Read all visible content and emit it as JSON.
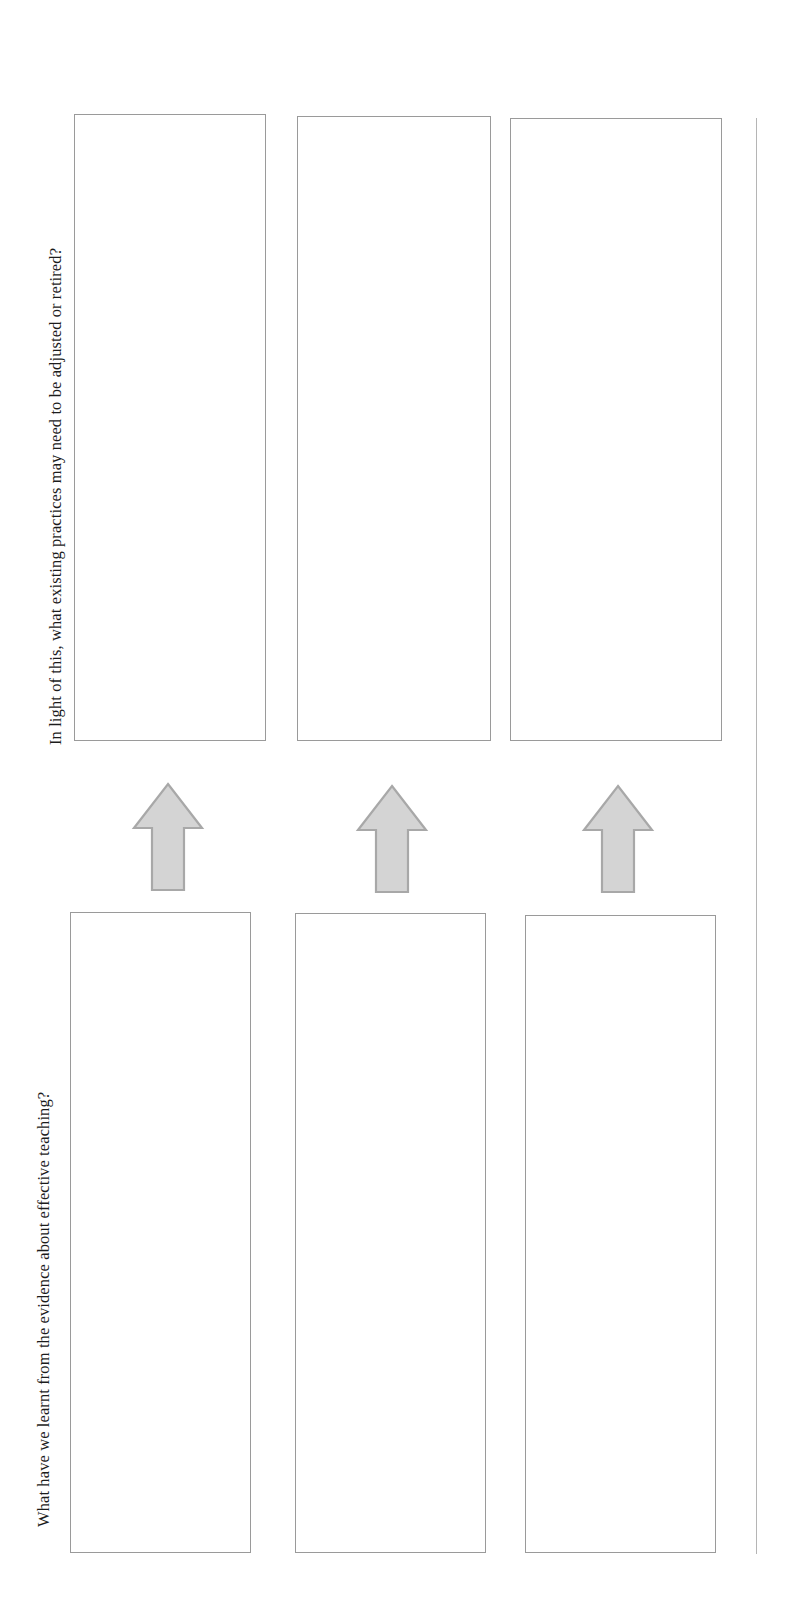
{
  "document": {
    "type": "worksheet-template",
    "orientation": "landscape-rotated",
    "background_color": "#ffffff",
    "box_border_color": "#9a9a9a",
    "arrow_fill_color": "#d4d4d4",
    "arrow_stroke_color": "#a8a8a8",
    "rule_color": "#b5b5b5"
  },
  "sections": {
    "upper": {
      "label": "In light of this, what existing practices may need to be adjusted or retired?",
      "boxes": [
        {
          "id": "upper-1",
          "content": ""
        },
        {
          "id": "upper-2",
          "content": ""
        },
        {
          "id": "upper-3",
          "content": ""
        }
      ]
    },
    "lower": {
      "label": "What have we learnt from the  evidence about effective teaching?",
      "boxes": [
        {
          "id": "lower-1",
          "content": ""
        },
        {
          "id": "lower-2",
          "content": ""
        },
        {
          "id": "lower-3",
          "content": ""
        }
      ]
    }
  },
  "connectors": [
    {
      "id": "arrow-1",
      "direction": "up",
      "from": "lower-1",
      "to": "upper-1"
    },
    {
      "id": "arrow-2",
      "direction": "up",
      "from": "lower-2",
      "to": "upper-2"
    },
    {
      "id": "arrow-3",
      "direction": "up",
      "from": "lower-3",
      "to": "upper-3"
    }
  ]
}
